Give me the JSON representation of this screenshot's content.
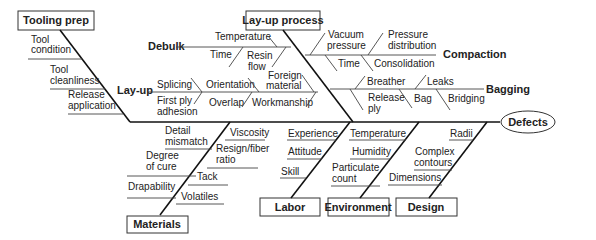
{
  "diagram": {
    "type": "fishbone",
    "effect": "Defects",
    "categories": {
      "tooling_prep": {
        "label": "Tooling prep",
        "causes": [
          "Tool condition",
          "Tool cleanliness",
          "Release application"
        ]
      },
      "layup_process": {
        "label": "Lay-up process",
        "sub_branches": {
          "debulk": {
            "label": "Debulk",
            "causes": [
              "Temperature",
              "Time",
              "Resin flow"
            ]
          },
          "layup": {
            "label": "Lay-up",
            "causes": [
              "Splicing",
              "Orientation",
              "Foreign material",
              "First ply adhesion",
              "Overlap",
              "Workmanship"
            ]
          },
          "compaction": {
            "label": "Compaction",
            "causes": [
              "Vacuum pressure",
              "Pressure distribution",
              "Time",
              "Consolidation"
            ]
          },
          "bagging": {
            "label": "Bagging",
            "causes": [
              "Breather",
              "Leaks",
              "Release ply",
              "Bag",
              "Bridging"
            ]
          }
        }
      },
      "materials": {
        "label": "Materials",
        "causes": [
          "Detail mismatch",
          "Viscosity",
          "Degree of cure",
          "Resign/fiber ratio",
          "Tack",
          "Drapability",
          "Volatiles"
        ]
      },
      "labor": {
        "label": "Labor",
        "causes": [
          "Experience",
          "Attitude",
          "Skill"
        ]
      },
      "environment": {
        "label": "Environment",
        "causes": [
          "Temperature",
          "Humidity",
          "Particulate count"
        ]
      },
      "design": {
        "label": "Design",
        "causes": [
          "Radii",
          "Complex contours",
          "Dimensions"
        ]
      }
    }
  }
}
